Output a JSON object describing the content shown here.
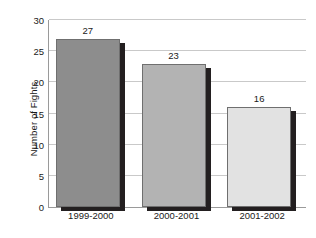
{
  "chart_data": {
    "type": "bar",
    "title": "",
    "subtitle": "",
    "xlabel": "",
    "ylabel": "Number of Fights",
    "categories": [
      "1999-2000",
      "2000-2001",
      "2001-2002"
    ],
    "values": [
      27,
      23,
      16
    ],
    "value_labels": [
      "27",
      "23",
      "16"
    ],
    "ylim": [
      0,
      30
    ],
    "ytick_step": 5,
    "ytick_labels": [
      "0",
      "5",
      "10",
      "15",
      "20",
      "25",
      "30"
    ],
    "ytick_values": [
      0,
      5,
      10,
      15,
      20,
      25,
      30
    ],
    "grid": true,
    "grid_axis": "y",
    "legend": false,
    "legend_position": "none",
    "bar_colors": [
      "#8d8d8d",
      "#b3b3b3",
      "#e2e2e2"
    ],
    "bar_edge_color": "#6f6f6f",
    "bar_shadow_color": "#231f20",
    "gridline_color": "#c9c9c9",
    "axis_color": "#9a9a9a",
    "text_color": "#1a1a1a",
    "background_color": "#ffffff"
  }
}
